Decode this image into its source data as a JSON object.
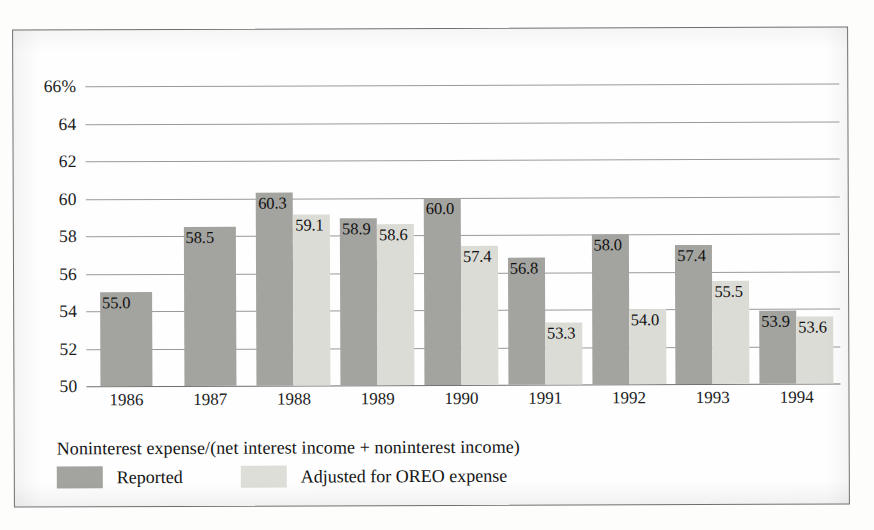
{
  "chart_data": {
    "type": "bar",
    "title": "",
    "subtitle": "",
    "xlabel": "",
    "ylabel": "",
    "ylim": [
      50,
      66
    ],
    "yticks": [
      "50",
      "52",
      "54",
      "56",
      "58",
      "60",
      "62",
      "64",
      "66%"
    ],
    "ytick_values": [
      50,
      52,
      54,
      56,
      58,
      60,
      62,
      64,
      66
    ],
    "grid": true,
    "legend_position": "bottom-left",
    "categories": [
      "1986",
      "1987",
      "1988",
      "1989",
      "1990",
      "1991",
      "1992",
      "1993",
      "1994"
    ],
    "series": [
      {
        "name": "Reported",
        "color": "#a3a39f",
        "values": [
          55.0,
          58.5,
          60.3,
          58.9,
          60.0,
          56.8,
          58.0,
          57.4,
          53.9
        ],
        "labels": [
          "55.0",
          "58.5",
          "60.3",
          "58.9",
          "60.0",
          "56.8",
          "58.0",
          "57.4",
          "53.9"
        ]
      },
      {
        "name": "Adjusted for OREO expense",
        "color": "#dcdcd7",
        "values": [
          null,
          null,
          59.1,
          58.6,
          57.4,
          53.3,
          54.0,
          55.5,
          53.6
        ],
        "labels": [
          "",
          "",
          "59.1",
          "58.6",
          "57.4",
          "53.3",
          "54.0",
          "55.5",
          "53.6"
        ]
      }
    ],
    "caption": "Noninterest expense/(net interest income + noninterest income)"
  },
  "legend": {
    "caption": "Noninterest expense/(net interest income + noninterest income)",
    "entries": [
      {
        "label": "Reported",
        "color": "#a3a39f"
      },
      {
        "label": "Adjusted for OREO expense",
        "color": "#dedeD9"
      }
    ]
  }
}
